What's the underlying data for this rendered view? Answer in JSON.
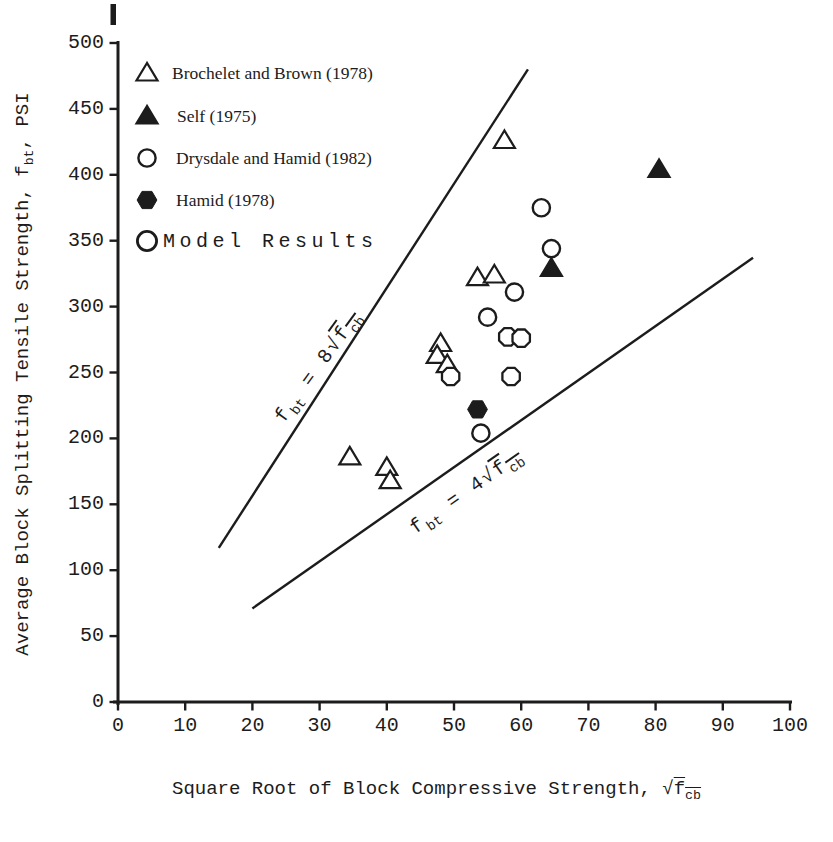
{
  "figure": {
    "background": "#ffffff",
    "ink": "#1c1c1c"
  },
  "legend": {
    "items": [
      {
        "marker": "open-triangle",
        "label": "Brochelet and Brown (1978)"
      },
      {
        "marker": "filled-triangle",
        "label": "Self (1975)"
      },
      {
        "marker": "open-circle",
        "label": "Drysdale and Hamid (1982)"
      },
      {
        "marker": "filled-hexagon",
        "label": "Hamid (1978)"
      },
      {
        "marker": "open-circle",
        "label": "Model Results"
      }
    ]
  },
  "chart_data": {
    "type": "scatter",
    "title": "",
    "xlabel": "Square Root of Block Compressive Strength, √f_cb",
    "ylabel": "Average Block Splitting Tensile Strength, f_bt, PSI",
    "xlim": [
      0,
      100
    ],
    "ylim": [
      0,
      500
    ],
    "x_ticks": [
      0,
      10,
      20,
      30,
      40,
      50,
      60,
      70,
      80,
      90,
      100
    ],
    "y_ticks": [
      0,
      50,
      100,
      150,
      200,
      250,
      300,
      350,
      400,
      450,
      500
    ],
    "grid": false,
    "legend_position": "upper-left-inside",
    "series": [
      {
        "name": "Brochelet and Brown (1978)",
        "marker": "open-triangle",
        "points": [
          [
            57.5,
            426
          ],
          [
            53.5,
            322
          ],
          [
            56,
            324
          ],
          [
            48,
            272
          ],
          [
            47.5,
            263
          ],
          [
            49,
            256
          ],
          [
            34.5,
            186
          ],
          [
            40,
            178
          ],
          [
            40.5,
            168
          ]
        ]
      },
      {
        "name": "Self (1975)",
        "marker": "filled-triangle",
        "points": [
          [
            80.5,
            404
          ],
          [
            64.5,
            329
          ]
        ]
      },
      {
        "name": "Drysdale and Hamid (1982)",
        "marker": "open-circle",
        "points": [
          [
            63,
            375
          ],
          [
            64.5,
            344
          ],
          [
            59,
            311
          ],
          [
            55,
            292
          ],
          [
            54,
            204
          ]
        ]
      },
      {
        "name": "Hamid (1978)",
        "marker": "filled-hexagon",
        "points": [
          [
            53.5,
            222
          ]
        ]
      },
      {
        "name": "Model Results",
        "marker": "open-octagon",
        "points": [
          [
            58,
            277
          ],
          [
            60,
            276
          ],
          [
            49.5,
            247
          ],
          [
            58.5,
            247
          ]
        ]
      }
    ],
    "reference_lines": [
      {
        "label": "f_bt = 8√f_cb",
        "from": [
          15,
          117
        ],
        "to": [
          61,
          480
        ]
      },
      {
        "label": "f_bt = 4√f_cb",
        "from": [
          20,
          71
        ],
        "to": [
          94.5,
          337
        ]
      }
    ]
  },
  "rich_text": {
    "ylabel_parts": [
      {
        "t": "Average Block Splitting Tensile Strength, f"
      },
      {
        "t": "bt",
        "s": "sub"
      },
      {
        "t": ", PSI"
      }
    ],
    "xlabel_parts": [
      {
        "t": "Square Root of Block Compressive Strength, "
      },
      {
        "t": "√"
      },
      {
        "s": "ol",
        "parts": [
          {
            "t": "f"
          },
          {
            "t": "cb",
            "s": "sub"
          }
        ]
      }
    ],
    "ref_line_parts": [
      [
        {
          "t": "f"
        },
        {
          "t": "bt",
          "s": "sub"
        },
        {
          "t": " = 8"
        },
        {
          "t": "√"
        },
        {
          "s": "ol",
          "parts": [
            {
              "t": "f"
            },
            {
              "t": "cb",
              "s": "sub"
            }
          ]
        }
      ],
      [
        {
          "t": "f"
        },
        {
          "t": "bt",
          "s": "sub"
        },
        {
          "t": " = 4"
        },
        {
          "t": "√"
        },
        {
          "s": "ol",
          "parts": [
            {
              "t": "f"
            },
            {
              "t": "cb",
              "s": "sub"
            }
          ]
        }
      ]
    ]
  }
}
